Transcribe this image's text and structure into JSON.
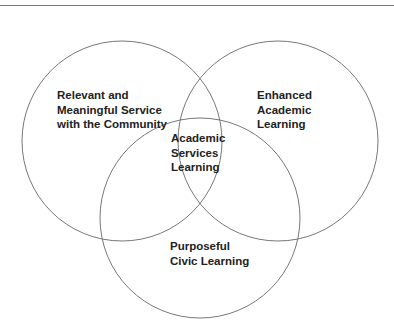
{
  "diagram": {
    "type": "venn",
    "stroke_color": "#777777",
    "circles": [
      {
        "id": "community",
        "label_lines": [
          "Relevant and",
          "Meaningful Service",
          "with the Community"
        ],
        "cx": 122,
        "cy": 141,
        "r": 100
      },
      {
        "id": "academic",
        "label_lines": [
          "Enhanced",
          "Academic",
          "Learning"
        ],
        "cx": 278,
        "cy": 141,
        "r": 100
      },
      {
        "id": "civic",
        "label_lines": [
          "Purposeful",
          "Civic Learning"
        ],
        "cx": 200,
        "cy": 218,
        "r": 100
      }
    ],
    "center_label_lines": [
      "Academic",
      "Services",
      "Learning"
    ]
  }
}
